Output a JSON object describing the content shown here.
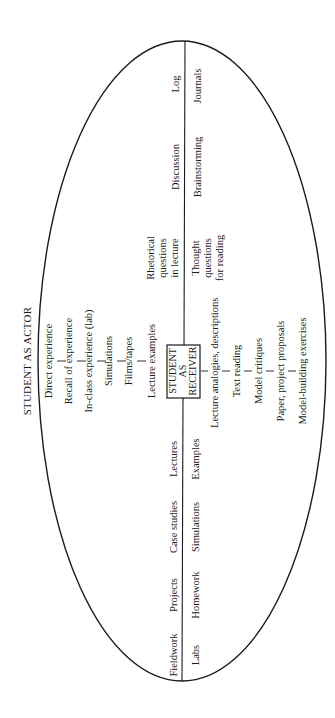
{
  "diagram": {
    "orientation": "rotated-90-ccw",
    "title_outside": "STUDENT AS ACTOR",
    "center_box": {
      "line1": "STUDENT",
      "line2": "AS",
      "line3": "RECEIVER"
    },
    "actor_chain": [
      "Direct experience",
      "Recall of experience",
      "In-class experience (lab)",
      "Simulations",
      "Films/tapes",
      "Lecture examples"
    ],
    "receiver_chain": [
      "Lecture analogies, descriptions",
      "Text reading",
      "Model critiques",
      "Paper, project proposals",
      "Model-building exercises"
    ],
    "axis_upper": {
      "left": [
        "Log",
        "Discussion"
      ],
      "right": [
        "Journals",
        "Brainstorming"
      ],
      "left_multi": [
        "Rhetorical",
        "questions",
        "in lecture"
      ],
      "right_multi": [
        "Thought",
        "questions",
        "for reading"
      ]
    },
    "axis_lower": {
      "left": [
        "Lectures",
        "Case studies",
        "Projects",
        "Fieldwork"
      ],
      "right": [
        "Examples",
        "Simulations",
        "Homework",
        "Labs"
      ]
    }
  }
}
